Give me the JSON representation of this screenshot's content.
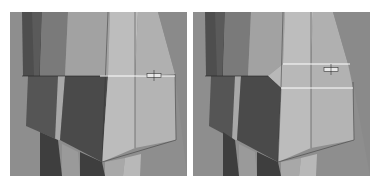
{
  "figure": {
    "panels": [
      {
        "id": "before",
        "description": "Mesh with single horizontal edge loop selected",
        "selected_edges": 1
      },
      {
        "id": "after",
        "description": "Mesh after edge bevel / chamfer with two edge loops",
        "selected_edges": 2
      }
    ],
    "colors": {
      "background": "#8c8c8c",
      "face_dark": "#4a4a4a",
      "face_mid": "#6e6e6e",
      "face_light": "#b4b4b4",
      "face_lighter": "#c4c4c4",
      "selected_edge": "#ffffff"
    }
  }
}
